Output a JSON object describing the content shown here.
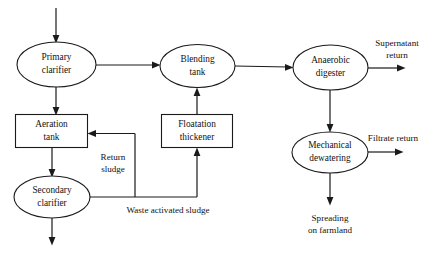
{
  "diagram": {
    "colors": {
      "stroke": "#1a1a1a",
      "background": "#ffffff",
      "text": "#111111"
    },
    "nodes": {
      "primary_clarifier": {
        "line1": "Primary",
        "line2": "clarifier",
        "shape": "ellipse"
      },
      "blending_tank": {
        "line1": "Blending",
        "line2": "tank",
        "shape": "ellipse"
      },
      "anaerobic_digester": {
        "line1": "Anaerobic",
        "line2": "digester",
        "shape": "ellipse"
      },
      "aeration_tank": {
        "line1": "Aeration",
        "line2": "tank",
        "shape": "rectangle"
      },
      "floatation_thickener": {
        "line1": "Floatation",
        "line2": "thickener",
        "shape": "rectangle"
      },
      "secondary_clarifier": {
        "line1": "Secondary",
        "line2": "clarifier",
        "shape": "ellipse"
      },
      "mechanical_dewatering": {
        "line1": "Mechanical",
        "line2": "dewatering",
        "shape": "ellipse"
      }
    },
    "edge_labels": {
      "return_sludge": {
        "line1": "Return",
        "line2": "sludge"
      },
      "waste_activated_sludge": {
        "line1": "Waste activated sludge"
      },
      "supernatant_return": {
        "line1": "Supernatant",
        "line2": "return"
      },
      "filtrate_return": {
        "line1": "Filtrate return"
      },
      "spreading_on_farmland": {
        "line1": "Spreading",
        "line2": "on farmland"
      }
    }
  }
}
